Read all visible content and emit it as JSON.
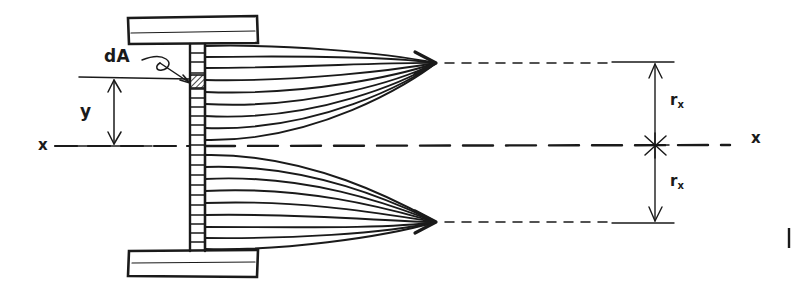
{
  "figure": {
    "background_color": "#ffffff",
    "ink_color": "#1a1a1a"
  },
  "labels": {
    "dA": "dA",
    "y": "y",
    "x_left": "x",
    "x_right": "x",
    "r_upper": "r",
    "r_upper_sub": "x",
    "r_lower": "r",
    "r_lower_sub": "x"
  },
  "geometry": {
    "neutral_axis_y": 145,
    "web_left_x": 190,
    "web_right_x": 205,
    "flange_left_x": 127,
    "flange_right_x": 258,
    "top_flange_y": 17,
    "bottom_flange_y": 250,
    "dA_element": {
      "x": 188,
      "y": 74,
      "width": 16,
      "height": 14
    },
    "resultant_arrow_tip_upper": {
      "x": 436,
      "y": 63
    },
    "resultant_arrow_tip_lower": {
      "x": 436,
      "y": 222
    },
    "centroid_marker": {
      "x": 655,
      "y": 145
    },
    "dimension_line_x": 655,
    "r_x_upper_span": [
      63,
      145
    ],
    "r_x_lower_span": [
      145,
      222
    ],
    "y_dimension_x": 114,
    "y_dimension_span": [
      77,
      145
    ]
  },
  "elements": {
    "web_rung_count": 22,
    "stress_curve_count_upper": 9,
    "stress_curve_count_lower": 9
  }
}
